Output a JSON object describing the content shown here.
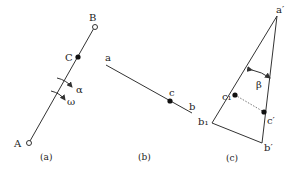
{
  "panels": {
    "a": {
      "caption": "(a)",
      "points": {
        "A": "A",
        "B": "B",
        "C": "C"
      },
      "symbols": {
        "alpha": "α",
        "omega": "ω"
      }
    },
    "b": {
      "caption": "(b)",
      "points": {
        "a": "a",
        "b": "b",
        "c": "c"
      }
    },
    "c": {
      "caption": "(c)",
      "points": {
        "a_prime": "a′",
        "b_prime": "b′",
        "c_prime": "c′",
        "b1": "b₁",
        "c1": "c₁"
      },
      "symbols": {
        "beta": "β"
      }
    }
  },
  "colors": {
    "line": "#333333",
    "text": "#222222",
    "background": "#ffffff"
  }
}
